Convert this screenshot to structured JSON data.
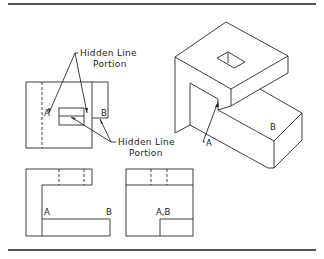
{
  "figure": {
    "colors": {
      "line": "#2a2a2a",
      "rule": "#555555",
      "background": "#ffffff"
    }
  },
  "callouts": {
    "top": {
      "line1": "Hidden Line",
      "line2": "Portion"
    },
    "bottom": {
      "line1": "Hidden Line",
      "line2": "Portion"
    }
  },
  "labels": {
    "front_view": {
      "a": "A",
      "b": "B"
    },
    "isometric": {
      "a": "A",
      "b": "B"
    },
    "bottom_left_view": {
      "a": "A",
      "b": "B"
    },
    "bottom_right_view": {
      "ab": "A,B"
    }
  },
  "views": [
    {
      "id": "top-left",
      "type": "orthographic-view-with-hidden-lines"
    },
    {
      "id": "isometric",
      "type": "isometric-pictorial"
    },
    {
      "id": "bottom-left",
      "type": "orthographic-view"
    },
    {
      "id": "bottom-right",
      "type": "orthographic-view"
    }
  ]
}
